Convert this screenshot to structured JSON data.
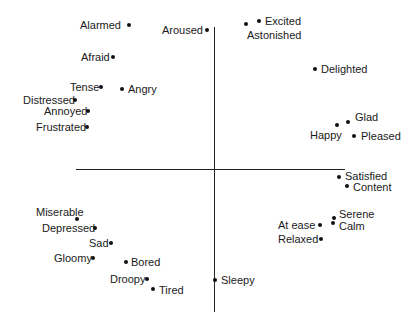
{
  "chart_data": {
    "type": "scatter",
    "title": "",
    "xlabel": "",
    "ylabel": "",
    "grid": false,
    "axes": {
      "horizontal": {
        "x1": 76,
        "x2": 345,
        "y": 169
      },
      "vertical": {
        "x": 214,
        "y1": 27,
        "y2": 312
      }
    },
    "points": [
      {
        "label": "Alarmed",
        "x": 129,
        "y": 25,
        "lx": 80,
        "ly": 19,
        "align": "left"
      },
      {
        "label": "Aroused",
        "x": 207,
        "y": 30,
        "lx": 162,
        "ly": 24,
        "align": "left"
      },
      {
        "label": "Excited",
        "x": 259,
        "y": 21,
        "lx": 265,
        "ly": 15,
        "align": "left"
      },
      {
        "label": "Astonished",
        "x": 246,
        "y": 24,
        "lx": 247,
        "ly": 29,
        "align": "left"
      },
      {
        "label": "Afraid",
        "x": 113,
        "y": 57,
        "lx": 81,
        "ly": 51,
        "align": "left"
      },
      {
        "label": "Delighted",
        "x": 315,
        "y": 69,
        "lx": 321,
        "ly": 63,
        "align": "left"
      },
      {
        "label": "Tense",
        "x": 101,
        "y": 87,
        "lx": 70,
        "ly": 81,
        "align": "left"
      },
      {
        "label": "Angry",
        "x": 122,
        "y": 89,
        "lx": 128,
        "ly": 83,
        "align": "left"
      },
      {
        "label": "Distressed",
        "x": 75,
        "y": 100,
        "lx": 23,
        "ly": 94,
        "align": "left"
      },
      {
        "label": "Annoyed",
        "x": 88,
        "y": 111,
        "lx": 44,
        "ly": 105,
        "align": "left"
      },
      {
        "label": "Frustrated",
        "x": 87,
        "y": 127,
        "lx": 36,
        "ly": 121,
        "align": "left"
      },
      {
        "label": "Glad",
        "x": 348,
        "y": 122,
        "lx": 355,
        "ly": 111,
        "align": "left"
      },
      {
        "label": "Happy",
        "x": 337,
        "y": 125,
        "lx": 310,
        "ly": 129,
        "align": "left"
      },
      {
        "label": "Pleased",
        "x": 354,
        "y": 136,
        "lx": 361,
        "ly": 130,
        "align": "left"
      },
      {
        "label": "Satisfied",
        "x": 339,
        "y": 177,
        "lx": 345,
        "ly": 170,
        "align": "left"
      },
      {
        "label": "Content",
        "x": 347,
        "y": 186,
        "lx": 353,
        "ly": 181,
        "align": "left"
      },
      {
        "label": "Serene",
        "x": 334,
        "y": 218,
        "lx": 339,
        "ly": 208,
        "align": "left"
      },
      {
        "label": "Calm",
        "x": 333,
        "y": 223,
        "lx": 339,
        "ly": 220,
        "align": "left"
      },
      {
        "label": "At ease",
        "x": 320,
        "y": 225,
        "lx": 278,
        "ly": 219,
        "align": "left"
      },
      {
        "label": "Relaxed",
        "x": 321,
        "y": 239,
        "lx": 278,
        "ly": 233,
        "align": "left"
      },
      {
        "label": "Miserable",
        "x": 77,
        "y": 219,
        "lx": 36,
        "ly": 206,
        "align": "left"
      },
      {
        "label": "Depressed",
        "x": 95,
        "y": 228,
        "lx": 42,
        "ly": 222,
        "align": "left"
      },
      {
        "label": "Sad",
        "x": 111,
        "y": 243,
        "lx": 89,
        "ly": 237,
        "align": "left"
      },
      {
        "label": "Gloomy",
        "x": 93,
        "y": 258,
        "lx": 54,
        "ly": 252,
        "align": "left"
      },
      {
        "label": "Bored",
        "x": 126,
        "y": 262,
        "lx": 131,
        "ly": 256,
        "align": "left"
      },
      {
        "label": "Droopy",
        "x": 147,
        "y": 279,
        "lx": 110,
        "ly": 273,
        "align": "left"
      },
      {
        "label": "Tired",
        "x": 153,
        "y": 289,
        "lx": 159,
        "ly": 284,
        "align": "left"
      },
      {
        "label": "Sleepy",
        "x": 215,
        "y": 280,
        "lx": 221,
        "ly": 274,
        "align": "left"
      }
    ]
  },
  "colors": {
    "background": "#ffffff",
    "ink": "#1a1a1a",
    "axis": "#222222"
  }
}
